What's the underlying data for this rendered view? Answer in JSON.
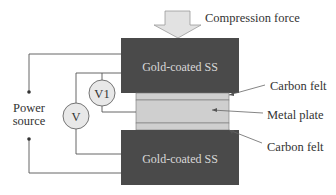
{
  "diagram": {
    "force_label": "Compression force",
    "top_block_label": "Gold-coated SS",
    "bottom_block_label": "Gold-coated SS",
    "layers": [
      {
        "label": "Carbon felt"
      },
      {
        "label": "Metal plate"
      },
      {
        "label": "Carbon felt"
      }
    ],
    "power_label_line1": "Power",
    "power_label_line2": "source",
    "meters": [
      {
        "label": "V1"
      },
      {
        "label": "V"
      }
    ],
    "colors": {
      "block": "#4a4a4a",
      "layer": "#cfcfcf",
      "meter_fill": "#e8e8e8",
      "arrow_fill": "#e2e2e2",
      "line": "#555555"
    }
  }
}
